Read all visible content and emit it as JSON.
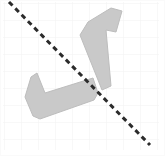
{
  "canvas": {
    "name": "shape-reflection-canvas",
    "width": 165,
    "height": 156,
    "background_color": "#ffffff",
    "description": "Two congruent L-shaped polygons on a faint grid with a dashed diagonal mirror line"
  },
  "grid": {
    "label": "background-grid",
    "cell_size": 17,
    "line_color": "#f1f1f1",
    "line_width": 1,
    "visible": true,
    "origin_x": 4,
    "origin_y": 3
  },
  "mirror_line": {
    "label": "dashed-mirror-line",
    "color": "#2b2b2b",
    "stroke_width": 3,
    "dash_length": 5,
    "gap_length": 4,
    "x1": 9,
    "y1": 2,
    "x2": 150,
    "y2": 145
  },
  "shapes": [
    {
      "id": "shape-upper-right",
      "label": "L-shaped polygon (upper right)",
      "fill_color": "#c9c9c9",
      "stroke_color": "#bdbdbd",
      "stroke_width": 1,
      "rotation_degrees": 19,
      "points": "88,22 111,8 122,11 116,32 106,30 111,86 102,90 80,35"
    },
    {
      "id": "shape-lower-left",
      "label": "L-shaped polygon (lower left)",
      "fill_color": "#c9c9c9",
      "stroke_color": "#bdbdbd",
      "stroke_width": 1,
      "rotation_degrees": -19,
      "points": "31,77 37,73 45,93 93,78 98,93 94,100 40,119 33,116 25,97"
    }
  ],
  "border": {
    "label": "canvas-border",
    "color": "#fafafa",
    "width": 1
  }
}
